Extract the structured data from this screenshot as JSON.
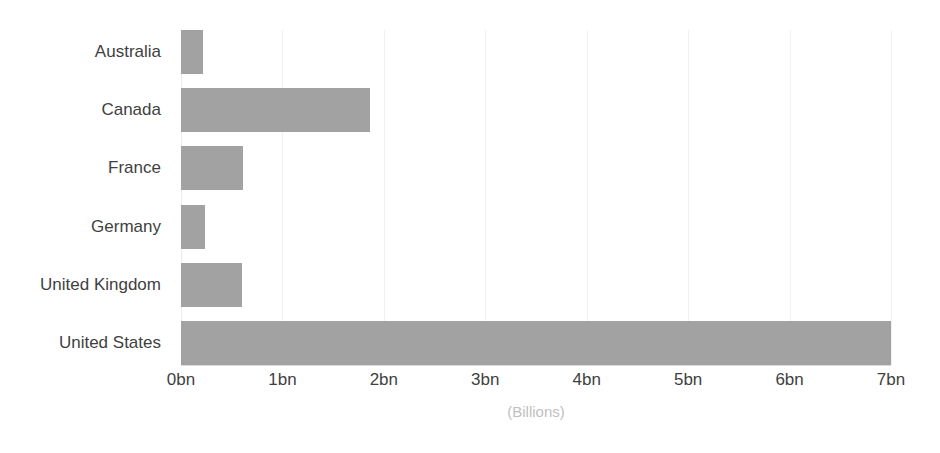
{
  "chart_data": {
    "type": "bar",
    "orientation": "horizontal",
    "title": "",
    "subtitle": "",
    "xlabel": "(Billions)",
    "ylabel": "",
    "categories": [
      "Australia",
      "Canada",
      "France",
      "Germany",
      "United Kingdom",
      "United States"
    ],
    "values": [
      0.22,
      1.86,
      0.61,
      0.24,
      0.6,
      7.0
    ],
    "series": [
      {
        "name": "",
        "values": [
          0.22,
          1.86,
          0.61,
          0.24,
          0.6,
          7.0
        ]
      }
    ],
    "xlim": [
      0,
      7
    ],
    "ylim": null,
    "xticks": [
      0,
      1,
      2,
      3,
      4,
      5,
      6,
      7
    ],
    "xtick_labels": [
      "0bn",
      "1bn",
      "2bn",
      "3bn",
      "4bn",
      "5bn",
      "6bn",
      "7bn"
    ],
    "grid": true,
    "grid_axis": "x",
    "legend": false,
    "legend_position": "none",
    "annotations": [],
    "data_labels": false,
    "bar_color": "#a2a2a2",
    "tick_label_color": "#3f3f3f",
    "axis_title_color": "#c0c0c0",
    "gridline_color": "#f0f0f0",
    "background_color": "#ffffff"
  }
}
